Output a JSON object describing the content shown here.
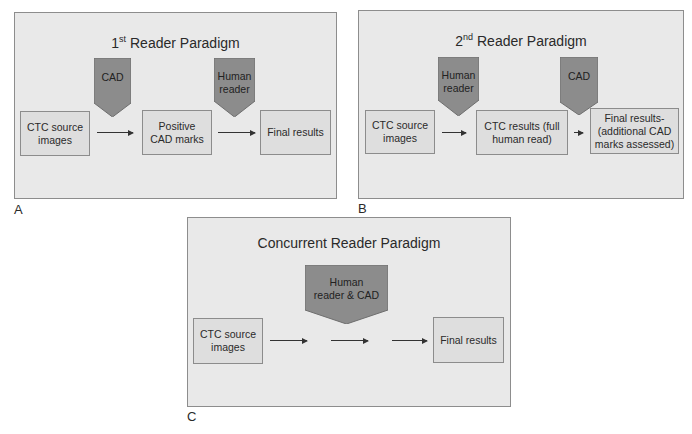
{
  "colors": {
    "panel_bg": "#e9e9e9",
    "box_fill": "#dedede",
    "border": "#8c8c8c",
    "pentagon_fill": "#8c8c8c"
  },
  "panels": {
    "a": {
      "letter": "A",
      "title_prefix": "1",
      "title_sup": "st",
      "title_rest": " Reader Paradigm",
      "boxes": [
        "CTC source images",
        "Positive CAD marks",
        "Final results"
      ],
      "pentagons": [
        "CAD",
        "Human reader"
      ]
    },
    "b": {
      "letter": "B",
      "title_prefix": "2",
      "title_sup": "nd",
      "title_rest": " Reader Paradigm",
      "boxes": [
        "CTC source images",
        "CTC results (full human read)",
        "Final results- (additional CAD marks assessed)"
      ],
      "pentagons": [
        "Human reader",
        "CAD"
      ]
    },
    "c": {
      "letter": "C",
      "title": "Concurrent Reader Paradigm",
      "boxes": [
        "CTC source images",
        "Final results"
      ],
      "pentagons": [
        "Human reader & CAD"
      ]
    }
  }
}
